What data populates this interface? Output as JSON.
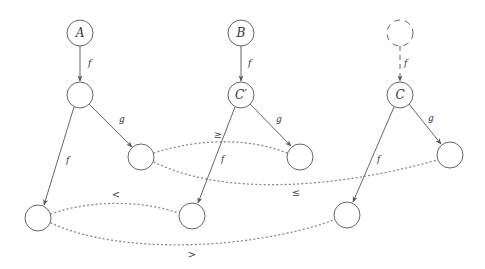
{
  "diagram": {
    "nodes": [
      {
        "id": "A",
        "label": "A",
        "x": 80,
        "y": 33,
        "style": "solid"
      },
      {
        "id": "B",
        "label": "B",
        "x": 241,
        "y": 33,
        "style": "solid"
      },
      {
        "id": "D",
        "label": "",
        "x": 400,
        "y": 33,
        "style": "dashed"
      },
      {
        "id": "N1",
        "label": "",
        "x": 80,
        "y": 95,
        "style": "solid"
      },
      {
        "id": "Cp",
        "label": "C′",
        "x": 241,
        "y": 95,
        "style": "solid"
      },
      {
        "id": "C",
        "label": "C",
        "x": 400,
        "y": 95,
        "style": "solid"
      },
      {
        "id": "N1g",
        "label": "",
        "x": 141,
        "y": 157,
        "style": "solid"
      },
      {
        "id": "Cpg",
        "label": "",
        "x": 300,
        "y": 157,
        "style": "solid"
      },
      {
        "id": "Cg",
        "label": "",
        "x": 450,
        "y": 155,
        "style": "solid"
      },
      {
        "id": "N1f",
        "label": "",
        "x": 38,
        "y": 218,
        "style": "solid"
      },
      {
        "id": "Cpf",
        "label": "",
        "x": 192,
        "y": 216,
        "style": "solid"
      },
      {
        "id": "Cf",
        "label": "",
        "x": 347,
        "y": 215,
        "style": "solid"
      }
    ],
    "edges": [
      {
        "from": "A",
        "to": "N1",
        "label": "f",
        "style": "solid"
      },
      {
        "from": "B",
        "to": "Cp",
        "label": "f",
        "style": "solid"
      },
      {
        "from": "D",
        "to": "C",
        "label": "f",
        "style": "dashed"
      },
      {
        "from": "N1",
        "to": "N1g",
        "label": "g",
        "style": "solid"
      },
      {
        "from": "N1",
        "to": "N1f",
        "label": "f",
        "style": "solid"
      },
      {
        "from": "Cp",
        "to": "Cpg",
        "label": "g",
        "style": "solid"
      },
      {
        "from": "Cp",
        "to": "Cpf",
        "label": "f",
        "style": "solid"
      },
      {
        "from": "C",
        "to": "Cg",
        "label": "g",
        "style": "solid"
      },
      {
        "from": "C",
        "to": "Cf",
        "label": "f",
        "style": "solid"
      }
    ],
    "relations": [
      {
        "from": "N1g",
        "to": "Cpg",
        "label": "≥"
      },
      {
        "from": "N1g",
        "to": "Cg",
        "label": "≤"
      },
      {
        "from": "N1f",
        "to": "Cpf",
        "label": "<"
      },
      {
        "from": "N1f",
        "to": "Cf",
        "label": ">"
      }
    ],
    "edge_labels": {
      "A_N1": "f",
      "B_Cp": "f",
      "D_C": "f",
      "N1_N1g": "g",
      "N1_N1f": "f",
      "Cp_Cpg": "g",
      "Cp_Cpf": "f",
      "C_Cg": "g",
      "C_Cf": "f"
    },
    "node_labels": {
      "A": "A",
      "B": "B",
      "Cp": "C′",
      "C": "C"
    },
    "relation_labels": {
      "ge": "≥",
      "le": "≤",
      "lt": "<",
      "gt": ">"
    }
  }
}
